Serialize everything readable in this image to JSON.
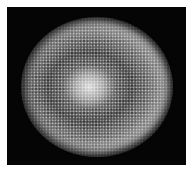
{
  "image": {
    "subject": "circular speckled colony with bright center and concentric rings on black background",
    "background_color": "#050505",
    "border_color": "#ffffff",
    "center_color": "#e6e6e6",
    "ring_color": "#c3c3c3",
    "inner_band_color": "#6e6e6e"
  }
}
